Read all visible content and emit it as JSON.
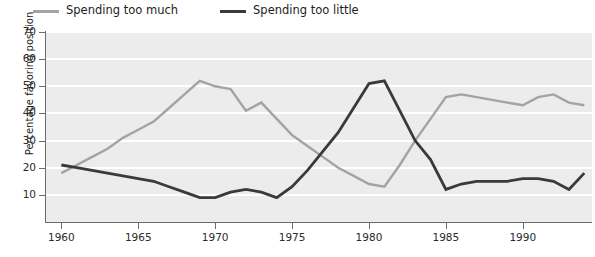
{
  "chart_data": {
    "type": "line",
    "title": "",
    "xlabel": "",
    "ylabel": "Percentage favoring position",
    "xlim": [
      1959,
      1994.5
    ],
    "ylim": [
      0,
      70
    ],
    "yticks": [
      10,
      20,
      30,
      40,
      50,
      60,
      70
    ],
    "xticks": [
      1960,
      1965,
      1970,
      1975,
      1980,
      1985,
      1990
    ],
    "grid": "horizontal-white-on-gray",
    "legend_position": "above-plot-left",
    "x": [
      1960,
      1961,
      1962,
      1963,
      1964,
      1965,
      1966,
      1967,
      1968,
      1969,
      1970,
      1971,
      1972,
      1973,
      1974,
      1975,
      1976,
      1977,
      1978,
      1979,
      1980,
      1981,
      1982,
      1983,
      1984,
      1985,
      1986,
      1987,
      1988,
      1989,
      1990,
      1991,
      1992,
      1993,
      1994
    ],
    "series": [
      {
        "name": "Spending too much",
        "color": "#a3a3a3",
        "values": [
          18,
          21,
          24,
          27,
          31,
          34,
          37,
          42,
          47,
          52,
          50,
          49,
          41,
          44,
          38,
          32,
          28,
          24,
          20,
          17,
          14,
          13,
          21,
          30,
          38,
          46,
          47,
          46,
          45,
          44,
          43,
          46,
          47,
          44,
          43
        ]
      },
      {
        "name": "Spending too little",
        "color": "#3a3a3a",
        "values": [
          21,
          20,
          19,
          18,
          17,
          16,
          15,
          13,
          11,
          9,
          9,
          11,
          12,
          11,
          9,
          13,
          19,
          26,
          33,
          42,
          51,
          52,
          41,
          30,
          23,
          12,
          14,
          15,
          15,
          15,
          16,
          16,
          15,
          12,
          18
        ]
      }
    ],
    "annotations": []
  },
  "legend": {
    "items": [
      {
        "label": "Spending too much",
        "color": "#a3a3a3"
      },
      {
        "label": "Spending too little",
        "color": "#3a3a3a"
      }
    ]
  },
  "axes": {
    "y_title": "Percentage favoring position",
    "y_tick_labels": [
      "70",
      "60",
      "50",
      "40",
      "30",
      "20",
      "10"
    ],
    "x_tick_labels": [
      "1960",
      "1965",
      "1970",
      "1975",
      "1980",
      "1985",
      "1990"
    ]
  }
}
